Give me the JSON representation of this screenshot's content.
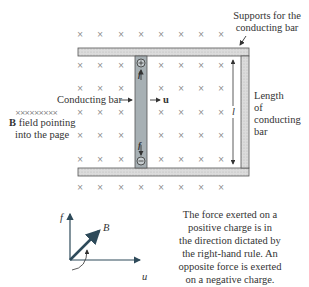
{
  "labels": {
    "supports": [
      "Supports for the",
      "conducting bar"
    ],
    "length": [
      "Length",
      "of",
      "conducting",
      "bar"
    ],
    "length_symbol": "l",
    "conducting_bar": "Conducting bar",
    "velocity": "u",
    "b_field_marks": "×××××××××",
    "b_field_bold": "B",
    "b_field_line1_rest": " field pointing",
    "b_field_line2": "into the page",
    "force_top": "f",
    "force_bottom": "f",
    "positive_charge": "+",
    "negative_charge": "−",
    "axes": {
      "f": "f",
      "B": "B",
      "u": "u"
    },
    "explanation": [
      "The force exerted on a",
      "positive charge is in",
      "the direction dictated by",
      "the right-hand rule. An",
      "opposite force is exerted",
      "on a negative charge."
    ]
  },
  "colors": {
    "rail_fill": "#d8d8d8",
    "bar_fill": "#a7b0b4",
    "outline": "#555555",
    "x_mark": "#8a8a8a",
    "vector": "#2e4a5a"
  }
}
